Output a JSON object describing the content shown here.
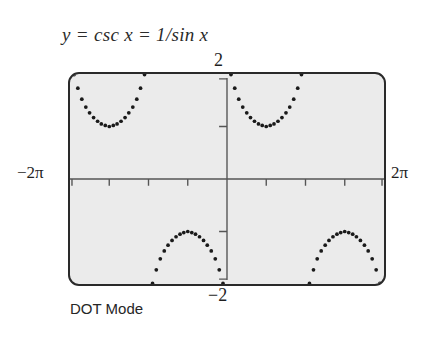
{
  "title": "y = csc x = 1/sin x",
  "caption": "DOT Mode",
  "axis_labels": {
    "x_min": "−2π",
    "x_max": "2π",
    "y_max": "2",
    "y_min": "−2"
  },
  "colors": {
    "screen_background": "#ebebeb",
    "screen_border": "#2a2a2a",
    "axis": "#555555",
    "dots": "#1a1a1a",
    "text": "#2b2b2b"
  },
  "chart_data": {
    "type": "scatter",
    "title": "y = csc x = 1/sin x",
    "subtitle": "DOT Mode",
    "xlabel": "",
    "ylabel": "",
    "xlim": [
      -6.283185,
      6.283185
    ],
    "ylim": [
      -2,
      2
    ],
    "grid": false,
    "legend": null,
    "x_tick_labels": [
      "−2π",
      "2π"
    ],
    "y_tick_labels": [
      "2",
      "−2"
    ],
    "x_tick_interval": 1.570796,
    "x_ticks": [
      -4.712389,
      -3.141593,
      -1.570796,
      1.570796,
      3.141593,
      4.712389
    ],
    "y_ticks": [
      -1,
      1
    ],
    "function": "y = csc(x) = 1/sin(x)",
    "asymptotes": [
      -6.283185,
      -3.141593,
      0,
      3.141593,
      6.283185
    ],
    "series": [
      {
        "name": "csc x branch (-2π, -π)",
        "x": [
          -6.12,
          -5.97,
          -5.81,
          -5.65,
          -5.5,
          -5.34,
          -5.18,
          -5.03,
          -4.87,
          -4.71,
          -4.55,
          -4.4,
          -4.24,
          -4.08,
          -3.93,
          -3.77,
          -3.61,
          -3.46,
          -3.3
        ],
        "y": [
          1.99,
          1.73,
          1.52,
          1.37,
          1.26,
          1.17,
          1.1,
          1.05,
          1.02,
          1.0,
          1.02,
          1.05,
          1.1,
          1.17,
          1.26,
          1.37,
          1.52,
          1.73,
          1.99
        ]
      },
      {
        "name": "csc x branch (-π, 0)",
        "x": [
          -2.98,
          -2.83,
          -2.67,
          -2.51,
          -2.36,
          -2.2,
          -2.04,
          -1.88,
          -1.73,
          -1.57,
          -1.41,
          -1.26,
          -1.1,
          -0.94,
          -0.79,
          -0.63,
          -0.47,
          -0.31,
          -0.16
        ],
        "y": [
          -1.99,
          -1.73,
          -1.52,
          -1.37,
          -1.26,
          -1.17,
          -1.1,
          -1.05,
          -1.02,
          -1.0,
          -1.02,
          -1.05,
          -1.1,
          -1.17,
          -1.26,
          -1.37,
          -1.52,
          -1.73,
          -1.99
        ]
      },
      {
        "name": "csc x branch (0, π)",
        "x": [
          0.16,
          0.31,
          0.47,
          0.63,
          0.79,
          0.94,
          1.1,
          1.26,
          1.41,
          1.57,
          1.73,
          1.88,
          2.04,
          2.2,
          2.36,
          2.51,
          2.67,
          2.83,
          2.98
        ],
        "y": [
          1.99,
          1.73,
          1.52,
          1.37,
          1.26,
          1.17,
          1.1,
          1.05,
          1.02,
          1.0,
          1.02,
          1.05,
          1.1,
          1.17,
          1.26,
          1.37,
          1.52,
          1.73,
          1.99
        ]
      },
      {
        "name": "csc x branch (π, 2π)",
        "x": [
          3.3,
          3.46,
          3.61,
          3.77,
          3.93,
          4.08,
          4.24,
          4.4,
          4.55,
          4.71,
          4.87,
          5.03,
          5.18,
          5.34,
          5.5,
          5.65,
          5.81,
          5.97,
          6.12
        ],
        "y": [
          -1.99,
          -1.73,
          -1.52,
          -1.37,
          -1.26,
          -1.17,
          -1.1,
          -1.05,
          -1.02,
          -1.0,
          -1.02,
          -1.05,
          -1.1,
          -1.17,
          -1.26,
          -1.37,
          -1.52,
          -1.73,
          -1.99
        ]
      }
    ]
  }
}
